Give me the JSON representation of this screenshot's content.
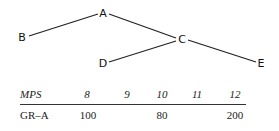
{
  "tree": {
    "nodes": [
      {
        "id": "A",
        "label": "A",
        "x": 103,
        "y": 13
      },
      {
        "id": "B",
        "label": "B",
        "x": 22,
        "y": 37
      },
      {
        "id": "C",
        "label": "C",
        "x": 182,
        "y": 39
      },
      {
        "id": "D",
        "label": "D",
        "x": 103,
        "y": 63
      },
      {
        "id": "E",
        "label": "E",
        "x": 261,
        "y": 63
      }
    ],
    "edges": [
      {
        "from": "A",
        "to": "B"
      },
      {
        "from": "A",
        "to": "C"
      },
      {
        "from": "C",
        "to": "D"
      },
      {
        "from": "C",
        "to": "E"
      }
    ]
  },
  "table": {
    "header": {
      "label": "MPS",
      "columns": [
        "8",
        "9",
        "10",
        "11",
        "12"
      ]
    },
    "rows": [
      {
        "label": "GR–A",
        "values": [
          "100",
          "",
          "80",
          "",
          "200"
        ]
      }
    ]
  }
}
